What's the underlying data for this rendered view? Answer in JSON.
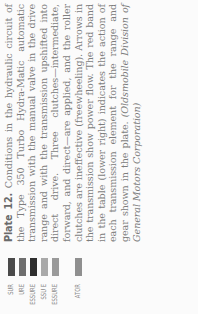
{
  "caption": {
    "plate_label": "Plate 12.",
    "body": "Conditions in the hydraulic circuit of the Type 350 Turbo Hydra-Matic automatic transmission with the manual valve in the drive range and with the transmission upshifted into direct drive. Three clutches—intermediate, forward, and direct—are applied, and the roller clutches are ineffective (freewheeling). Arrows in the transmission show power flow. The red band in the table (lower right) indicates the action of each transmission element for the range and gear shown in the plate.",
    "credit": "(Oldsmobile Division of General Motors Corporation)"
  },
  "legend": {
    "items": [
      {
        "label": "SUR",
        "color": "#4a4a4a"
      },
      {
        "label": "URE",
        "color": "#6e6e6e"
      },
      {
        "label": "ESSURE",
        "color": "#2e2e2e"
      },
      {
        "label": "SSU E",
        "color": "#a9a9a9"
      },
      {
        "label": "ESSURE",
        "color": "#9a9a9a"
      },
      {
        "label": "ATOR",
        "color": "#8f8f8f"
      }
    ]
  }
}
